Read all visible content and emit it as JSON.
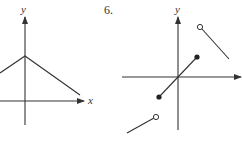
{
  "figures": [
    {
      "number": "",
      "x_label": "x",
      "y_label": "y",
      "description": "Absolute-value-like V-shape inverted: line from left rising to peak on y-axis then descending right"
    },
    {
      "number": "6.",
      "x_label": "",
      "y_label": "y",
      "description": "Piecewise function with three segments: lower-left segment ending in open circle, middle segment through origin with closed endpoints, upper-right segment starting with open circle"
    }
  ]
}
